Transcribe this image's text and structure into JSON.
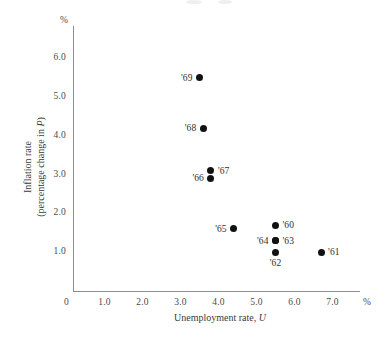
{
  "chart_data": {
    "type": "scatter",
    "title": "",
    "xlabel": "Unemployment rate, U",
    "xlabel_main": "Unemployment rate,",
    "xlabel_italic": "U",
    "ylabel": "Inflation rate (percentage change in P)",
    "ylabel_line1": "Inflation rate",
    "ylabel_line2_pre": "(percentage change in ",
    "ylabel_line2_italic": "P",
    "ylabel_line2_post": ")",
    "x_unit": "%",
    "y_unit": "%",
    "xlim": [
      0,
      7.6
    ],
    "ylim": [
      0,
      6.8
    ],
    "grid": false,
    "legend": false,
    "x_ticks": [
      "0",
      "1.0",
      "2.0",
      "3.0",
      "4.0",
      "5.0",
      "6.0",
      "7.0"
    ],
    "x_tick_values": [
      0,
      1,
      2,
      3,
      4,
      5,
      6,
      7
    ],
    "y_ticks": [
      "1.0",
      "2.0",
      "3.0",
      "4.0",
      "5.0",
      "6.0"
    ],
    "y_tick_values": [
      1,
      2,
      3,
      4,
      5,
      6
    ],
    "point_color": "#111111",
    "axis_color": "#8d8d8d",
    "points": [
      {
        "label": "'60",
        "x": 5.5,
        "y": 1.7,
        "label_pos": "right"
      },
      {
        "label": "'61",
        "x": 6.7,
        "y": 1.0,
        "label_pos": "right"
      },
      {
        "label": "'62",
        "x": 5.5,
        "y": 1.0,
        "label_pos": "below"
      },
      {
        "label": "'63",
        "x": 5.5,
        "y": 1.3,
        "label_pos": "right"
      },
      {
        "label": "'64",
        "x": 5.5,
        "y": 1.3,
        "label_pos": "left"
      },
      {
        "label": "'65",
        "x": 4.4,
        "y": 1.6,
        "label_pos": "left"
      },
      {
        "label": "'66",
        "x": 3.8,
        "y": 2.9,
        "label_pos": "left"
      },
      {
        "label": "'67",
        "x": 3.8,
        "y": 3.1,
        "label_pos": "right"
      },
      {
        "label": "'68",
        "x": 3.6,
        "y": 4.2,
        "label_pos": "left"
      },
      {
        "label": "'69",
        "x": 3.5,
        "y": 5.5,
        "label_pos": "left"
      }
    ]
  }
}
